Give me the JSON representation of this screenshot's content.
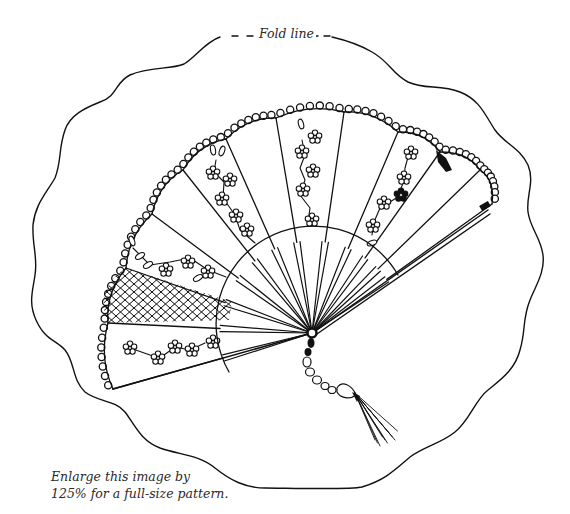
{
  "pattern": {
    "title": "Fan embroidery pattern",
    "fold_label": "Fold line",
    "note_lines": [
      "Enlarge this image by",
      "125% for a full-size pattern."
    ],
    "enlarge_percent": "125%",
    "colors": {
      "ink": "#111111",
      "paper": "#ffffff",
      "text": "#2a2a2a"
    },
    "motifs": {
      "blade_count": 9,
      "crosshatched_blade": "second from left",
      "filled_flower": "right blade",
      "tassel": "beaded cord with tassel"
    }
  }
}
